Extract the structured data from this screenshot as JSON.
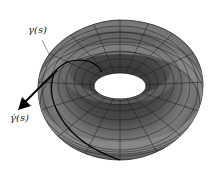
{
  "figure": {
    "labels": {
      "curve": "γ(s)",
      "tangent": "γ̇(s)"
    },
    "colors": {
      "surface_dark": "#3a3a3a",
      "surface_mid": "#6a6a6a",
      "surface_light": "#9a9a9a",
      "mesh": "#1a1a1a",
      "curve": "#000000",
      "background": "#ffffff"
    }
  }
}
